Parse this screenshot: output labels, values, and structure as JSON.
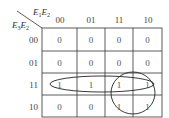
{
  "kmap": {
    "column_variable": {
      "base": "E",
      "subs": [
        "1",
        "2"
      ]
    },
    "row_variable": {
      "base": "E",
      "subs": [
        "3",
        "2"
      ]
    },
    "column_headers": [
      "00",
      "01",
      "11",
      "10"
    ],
    "row_headers": [
      "00",
      "01",
      "11",
      "10"
    ],
    "cells": [
      [
        "0",
        "0",
        "0",
        "0"
      ],
      [
        "0",
        "0",
        "0",
        "0"
      ],
      [
        "1",
        "1",
        "1",
        "1"
      ],
      [
        "0",
        "0",
        "1",
        "1"
      ]
    ],
    "groupings": [
      {
        "shape": "ellipse",
        "covers": "row 11, all columns"
      },
      {
        "shape": "circle",
        "covers": "rows 11-10, columns 11-10"
      }
    ]
  }
}
